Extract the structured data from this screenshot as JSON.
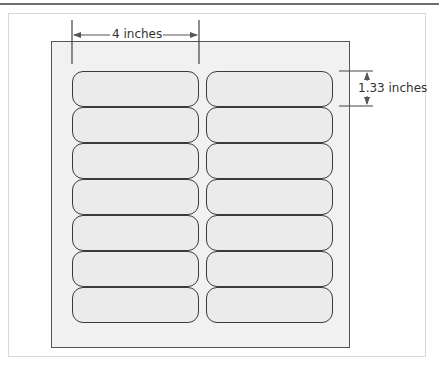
{
  "diagram": {
    "type": "label-sheet-layout",
    "sheet": {
      "columns": 2,
      "rows": 7,
      "label_count": 14
    },
    "dimensions": {
      "width_label": "4 inches",
      "height_label": "1.33 inches"
    },
    "colors": {
      "sheet_fill": "#f1f1f1",
      "label_fill": "#ebebeb",
      "label_stroke": "#3a3a3a",
      "dimension_line": "#555555"
    }
  }
}
